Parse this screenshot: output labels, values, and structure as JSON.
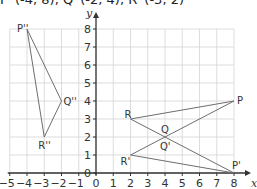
{
  "caption": "P''(-4, 8), Q''(-2, 4), R''(-3, 2)",
  "axes": {
    "x_label": "x",
    "y_label": "y",
    "x_ticks": [
      "-5",
      "-4",
      "-3",
      "-2",
      "-1",
      "0",
      "1",
      "2",
      "3",
      "4",
      "5",
      "6",
      "7",
      "8"
    ],
    "y_ticks": [
      "0",
      "1",
      "2",
      "3",
      "4",
      "5",
      "6",
      "7",
      "8"
    ],
    "x_range": [
      -5,
      8
    ],
    "y_range": [
      0,
      8
    ]
  },
  "shapes": [
    {
      "name": "original-triangle",
      "vertices": [
        {
          "label": "P",
          "x": 8,
          "y": 4
        },
        {
          "label": "Q",
          "x": 4,
          "y": 2
        },
        {
          "label": "R",
          "x": 2,
          "y": 3
        }
      ],
      "note": "drawn as bow-tie path P-R-P'/Q crossing"
    },
    {
      "name": "image-triangle",
      "vertices": [
        {
          "label": "P'",
          "x": 8,
          "y": 0
        },
        {
          "label": "Q'",
          "x": 4,
          "y": 2
        },
        {
          "label": "R'",
          "x": 2,
          "y": 1
        }
      ]
    },
    {
      "name": "double-image-triangle",
      "vertices": [
        {
          "label": "P''",
          "x": -4,
          "y": 8
        },
        {
          "label": "Q''",
          "x": -2,
          "y": 4
        },
        {
          "label": "R''",
          "x": -3,
          "y": 2
        }
      ]
    }
  ],
  "labels": {
    "P": "P",
    "Q": "Q",
    "R": "R",
    "P1": "P'",
    "Q1": "Q'",
    "R1": "R'",
    "P2": "P''",
    "Q2": "Q''",
    "R2": "R''"
  },
  "colors": {
    "grid": "#d4d4d4",
    "axis": "#333333",
    "shape": "#666666",
    "text": "#333333"
  }
}
